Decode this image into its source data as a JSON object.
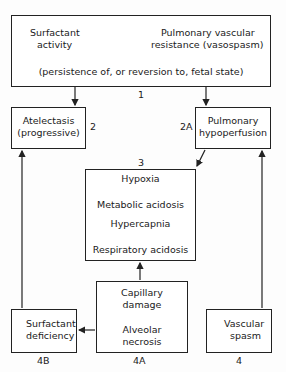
{
  "diagram": {
    "top_box": {
      "left_text": [
        "Surfactant",
        "activity"
      ],
      "left_direction": "down",
      "right_text": [
        "Pulmonary vascular",
        "resistance (vasospasm)"
      ],
      "right_direction": "up",
      "note": "(persistence of, or reversion to, fetal state)",
      "label": "1"
    },
    "atelectasis": {
      "lines": [
        "Atelectasis",
        "(progressive)"
      ],
      "label": "2"
    },
    "hypoperfusion": {
      "lines": [
        "Pulmonary",
        "hypoperfusion"
      ],
      "label": "2A"
    },
    "center": {
      "label": "3",
      "lines": [
        "Hypoxia",
        "Metabolic acidosis",
        "Hypercapnia",
        "Respiratory acidosis"
      ]
    },
    "damage": {
      "lines": [
        "Capillary",
        "damage",
        "Alveolar",
        "necrosis"
      ],
      "label": "4A"
    },
    "surfactant_def": {
      "lines": [
        "Surfactant",
        "deficiency"
      ],
      "direction": "up",
      "label": "4B"
    },
    "vascular": {
      "lines": [
        "Vascular",
        "spasm"
      ],
      "direction": "up",
      "label": "4"
    }
  }
}
